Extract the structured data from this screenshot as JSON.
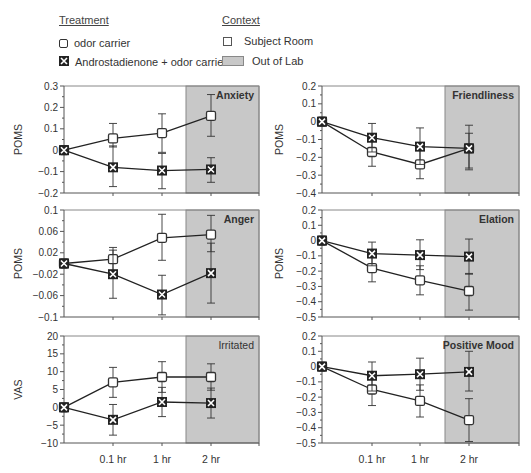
{
  "legend": {
    "treatment_title": "Treatment",
    "treatment_items": [
      {
        "label": "odor carrier",
        "marker": "open-square-icon"
      },
      {
        "label": "Androstadienone + odor carrier",
        "marker": "x-square-icon"
      }
    ],
    "context_title": "Context",
    "context_items": [
      {
        "label": "Subject Room",
        "swatch": "white-box"
      },
      {
        "label": "Out of Lab",
        "swatch": "gray-box"
      }
    ]
  },
  "colors": {
    "out_of_lab_fill": "#c8c8c8",
    "axis": "#555555",
    "line": "#222222",
    "text": "#333333"
  },
  "chart_data": [
    {
      "type": "line",
      "title": "Anxiety",
      "ylabel": "POMS",
      "xlabel": "",
      "categories": [
        "0",
        "0.1 hr",
        "1 hr",
        "2 hr"
      ],
      "ylim": [
        -0.2,
        0.3
      ],
      "yticks": [
        -0.2,
        -0.1,
        0,
        0.1,
        0.2,
        0.3
      ],
      "ytick_labels": [
        "-0.2",
        "-0.1",
        "0",
        "0.1",
        "0.2",
        "0.3"
      ],
      "shaded_region": {
        "label": "Out of Lab",
        "from_category": "2 hr"
      },
      "series": [
        {
          "name": "odor carrier",
          "values": [
            0,
            0.055,
            0.08,
            0.16
          ],
          "err_low": [
            0,
            0.015,
            -0.01,
            0.065
          ],
          "err_high": [
            0,
            0.125,
            0.17,
            0.26
          ]
        },
        {
          "name": "Androstadienone + odor carrier",
          "values": [
            0,
            -0.08,
            -0.095,
            -0.09
          ],
          "err_low": [
            0,
            -0.17,
            -0.18,
            -0.15
          ],
          "err_high": [
            0,
            0.02,
            -0.015,
            -0.035
          ]
        }
      ]
    },
    {
      "type": "line",
      "title": "Friendliness",
      "ylabel": "POMS",
      "xlabel": "",
      "categories": [
        "0",
        "0.1 hr",
        "1 hr",
        "2 hr"
      ],
      "ylim": [
        -0.4,
        0.2
      ],
      "yticks": [
        -0.4,
        -0.3,
        -0.2,
        -0.1,
        0,
        0.1,
        0.2
      ],
      "ytick_labels": [
        "-0.4",
        "-0.3",
        "-0.2",
        "-0.1",
        "0",
        "0.1",
        "0.2"
      ],
      "shaded_region": {
        "label": "Out of Lab",
        "from_category": "2 hr"
      },
      "series": [
        {
          "name": "odor carrier",
          "values": [
            0,
            -0.17,
            -0.24,
            -0.15
          ],
          "err_low": [
            0,
            -0.25,
            -0.32,
            -0.26
          ],
          "err_high": [
            0,
            -0.09,
            -0.16,
            -0.02
          ]
        },
        {
          "name": "Androstadienone + odor carrier",
          "values": [
            0,
            -0.09,
            -0.14,
            -0.15
          ],
          "err_low": [
            0,
            -0.17,
            -0.24,
            -0.27
          ],
          "err_high": [
            0,
            -0.01,
            -0.035,
            -0.065
          ]
        }
      ]
    },
    {
      "type": "line",
      "title": "Anger",
      "ylabel": "POMS",
      "xlabel": "",
      "categories": [
        "0",
        "0.1 hr",
        "1 hr",
        "2 hr"
      ],
      "ylim": [
        -0.1,
        0.1
      ],
      "yticks": [
        -0.1,
        -0.06,
        -0.02,
        0.02,
        0.06,
        0.1
      ],
      "ytick_labels": [
        "-0.1",
        "-0.06",
        "-0.02",
        "0.02",
        "0.06",
        "0.1"
      ],
      "shaded_region": {
        "label": "Out of Lab",
        "from_category": "2 hr"
      },
      "series": [
        {
          "name": "odor carrier",
          "values": [
            0,
            0.008,
            0.048,
            0.054
          ],
          "err_low": [
            0,
            -0.014,
            0.006,
            0.022
          ],
          "err_high": [
            0,
            0.03,
            0.092,
            0.09
          ]
        },
        {
          "name": "Androstadienone + odor carrier",
          "values": [
            0,
            -0.02,
            -0.058,
            -0.018
          ],
          "err_low": [
            0,
            -0.065,
            -0.096,
            -0.074
          ],
          "err_high": [
            0,
            0.025,
            -0.022,
            0.038
          ]
        }
      ]
    },
    {
      "type": "line",
      "title": "Elation",
      "ylabel": "POMS",
      "xlabel": "",
      "categories": [
        "0",
        "0.1 hr",
        "1 hr",
        "2 hr"
      ],
      "ylim": [
        -0.5,
        0.2
      ],
      "yticks": [
        -0.5,
        -0.4,
        -0.3,
        -0.2,
        -0.1,
        0,
        0.1,
        0.2
      ],
      "ytick_labels": [
        "-0.5",
        "-0.4",
        "-0.3",
        "-0.2",
        "-0.1",
        "0",
        "0.1",
        "0.2"
      ],
      "shaded_region": {
        "label": "Out of Lab",
        "from_category": "2 hr"
      },
      "series": [
        {
          "name": "odor carrier",
          "values": [
            0,
            -0.18,
            -0.26,
            -0.33
          ],
          "err_low": [
            0,
            -0.27,
            -0.355,
            -0.455
          ],
          "err_high": [
            0,
            -0.09,
            -0.165,
            -0.215
          ]
        },
        {
          "name": "Androstadienone + odor carrier",
          "values": [
            0,
            -0.085,
            -0.095,
            -0.105
          ],
          "err_low": [
            0,
            -0.165,
            -0.19,
            -0.22
          ],
          "err_high": [
            0,
            -0.01,
            0.005,
            0.01
          ]
        }
      ]
    },
    {
      "type": "line",
      "title": "Irritated",
      "ylabel": "VAS",
      "xlabel": "",
      "categories": [
        "0",
        "0.1 hr",
        "1 hr",
        "2 hr"
      ],
      "ylim": [
        -10,
        20
      ],
      "yticks": [
        -10,
        -5,
        0,
        5,
        10,
        15,
        20
      ],
      "ytick_labels": [
        "-10",
        "-5",
        "0",
        "5",
        "10",
        "15",
        "20"
      ],
      "shaded_region": {
        "label": "Out of Lab",
        "from_category": "2 hr"
      },
      "series": [
        {
          "name": "odor carrier",
          "values": [
            0,
            7,
            8.5,
            8.5
          ],
          "err_low": [
            0,
            2.8,
            4.2,
            4.8
          ],
          "err_high": [
            0,
            11.2,
            12.8,
            12.2
          ]
        },
        {
          "name": "Androstadienone + odor carrier",
          "values": [
            0,
            -3.5,
            1.5,
            1.2
          ],
          "err_low": [
            0,
            -7.8,
            -2.6,
            -3
          ],
          "err_high": [
            0,
            0.8,
            5.6,
            5.4
          ]
        }
      ]
    },
    {
      "type": "line",
      "title": "Positive Mood",
      "ylabel": "",
      "xlabel": "",
      "categories": [
        "0",
        "0.1 hr",
        "1 hr",
        "2 hr"
      ],
      "ylim": [
        -0.5,
        0.2
      ],
      "yticks": [
        -0.5,
        -0.4,
        -0.3,
        -0.2,
        -0.1,
        0,
        0.1,
        0.2
      ],
      "ytick_labels": [
        "-0.5",
        "-0.4",
        "-0.3",
        "-0.2",
        "-0.1",
        "0",
        "0.1",
        "0.2"
      ],
      "shaded_region": {
        "label": "Out of Lab",
        "from_category": "2 hr"
      },
      "series": [
        {
          "name": "odor carrier",
          "values": [
            0,
            -0.15,
            -0.225,
            -0.35
          ],
          "err_low": [
            0,
            -0.255,
            -0.33,
            -0.49
          ],
          "err_high": [
            0,
            -0.045,
            -0.12,
            -0.21
          ]
        },
        {
          "name": "Androstadienone + odor carrier",
          "values": [
            0,
            -0.06,
            -0.05,
            -0.035
          ],
          "err_low": [
            0,
            -0.16,
            -0.155,
            -0.16
          ],
          "err_high": [
            0,
            0.03,
            0.055,
            0.1
          ]
        }
      ]
    }
  ],
  "x_axis_labels": [
    "0.1 hr",
    "1 hr",
    "2 hr"
  ]
}
